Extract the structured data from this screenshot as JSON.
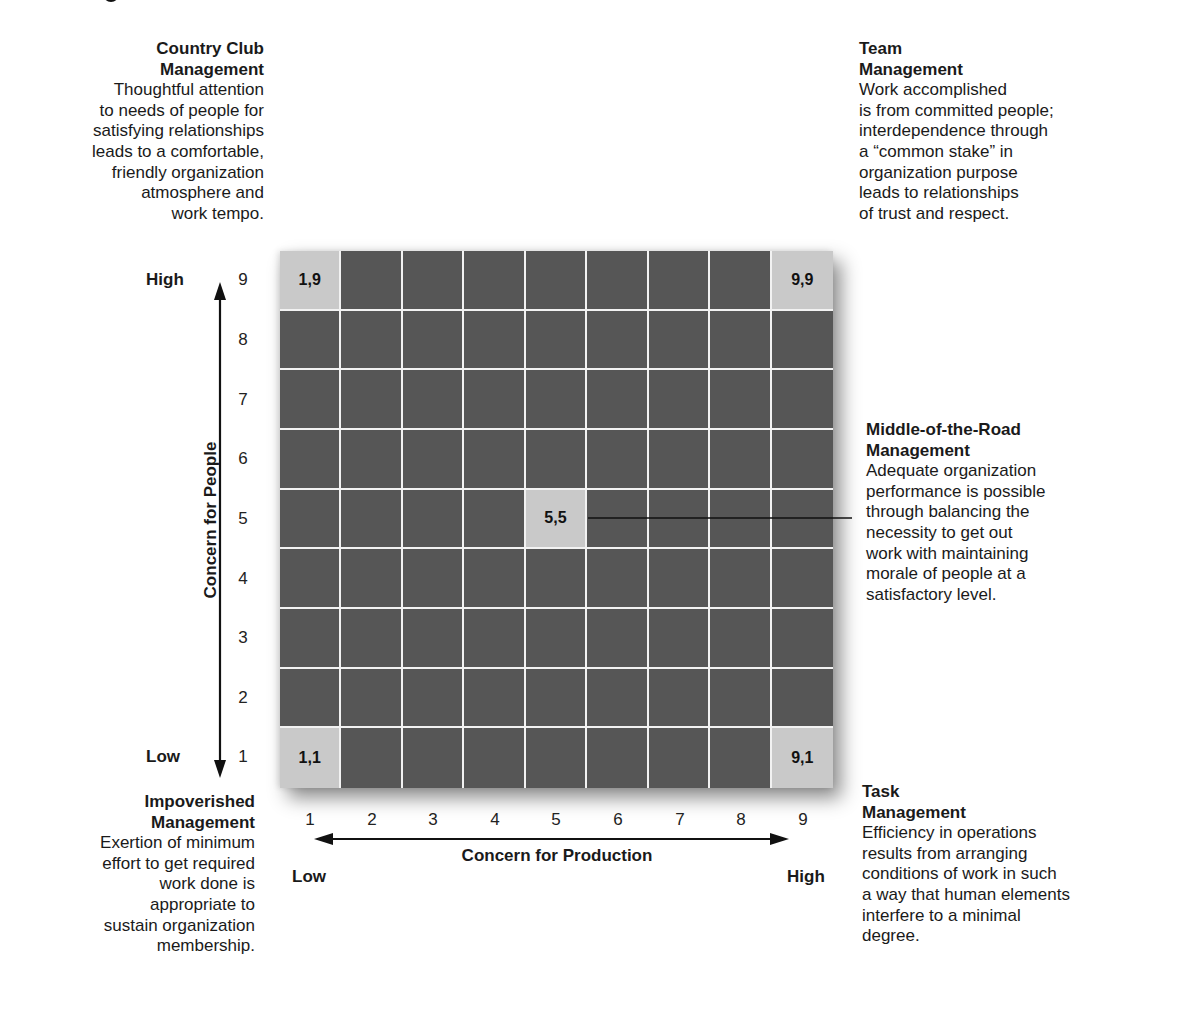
{
  "diagram": {
    "top_fragment": "",
    "y_axis": {
      "label": "Concern for People",
      "low_label": "Low",
      "high_label": "High",
      "ticks": [
        "9",
        "8",
        "7",
        "6",
        "5",
        "4",
        "3",
        "2",
        "1"
      ]
    },
    "x_axis": {
      "label": "Concern for Production",
      "low_label": "Low",
      "high_label": "High",
      "ticks": [
        "1",
        "2",
        "3",
        "4",
        "5",
        "6",
        "7",
        "8",
        "9"
      ]
    },
    "highlighted_cells": {
      "top_left": "1,9",
      "top_right": "9,9",
      "center": "5,5",
      "bottom_left": "1,1",
      "bottom_right": "9,1"
    },
    "colors": {
      "grid_dark": "#565656",
      "grid_highlight": "#c9c9c9",
      "grid_lines": "#f2f2f2",
      "text": "#1a1a1a"
    },
    "styles": {
      "country_club": {
        "title": "Country Club\nManagement",
        "body": "Thoughtful attention\nto needs of people for\nsatisfying relationships\nleads to a comfortable,\nfriendly organization\natmosphere and\nwork tempo."
      },
      "team": {
        "title": "Team\nManagement",
        "body": "Work accomplished\nis from committed people;\ninterdependence through\na “common stake” in\norganization purpose\nleads to relationships\nof trust and respect."
      },
      "middle_of_the_road": {
        "title": "Middle-of-the-Road\nManagement",
        "body": "Adequate organization\nperformance is possible\nthrough balancing the\nnecessity to get out\nwork with maintaining\nmorale of people at a\nsatisfactory level."
      },
      "impoverished": {
        "title": "Impoverished\nManagement",
        "body": "Exertion of minimum\neffort to get required\nwork done is\nappropriate to\nsustain organization\nmembership."
      },
      "task": {
        "title": "Task\nManagement",
        "body": "Efficiency in operations\nresults from arranging\nconditions of work in such\na way that human elements\ninterfere to a minimal\ndegree."
      }
    }
  }
}
